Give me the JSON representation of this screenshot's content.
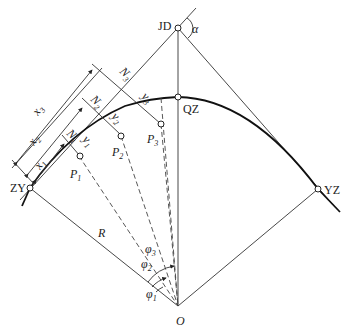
{
  "diagram": {
    "type": "circular curve detailing by tangent offset method",
    "points": {
      "JD": "JD",
      "QZ": "QZ",
      "ZY": "ZY",
      "YZ": "YZ",
      "O": "O",
      "P1": "P",
      "P2": "P",
      "P3": "P"
    },
    "subscripts": [
      "1",
      "2",
      "3"
    ],
    "labels": {
      "alpha": "α",
      "radius": "R",
      "x": "x",
      "y": "y",
      "N": "N",
      "phi": "φ",
      "P": "P"
    },
    "colors": {
      "line": "#333333",
      "curve": "#111111",
      "background": "#ffffff"
    }
  }
}
